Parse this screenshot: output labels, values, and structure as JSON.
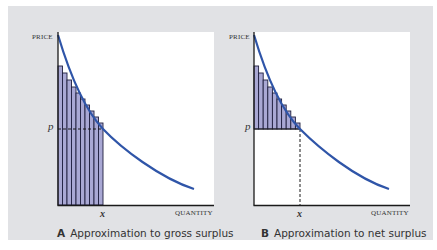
{
  "panels": [
    {
      "id": "A",
      "letter": "A",
      "caption": "Approximation to gross surplus",
      "y_axis_label": "PRICE",
      "x_axis_label": "QUANTITY",
      "price_label": "p",
      "quantity_label": "x",
      "shaded_region": "full bars from 0 to x",
      "bar_count": 10
    },
    {
      "id": "B",
      "letter": "B",
      "caption": "Approximation to net surplus",
      "y_axis_label": "PRICE",
      "x_axis_label": "QUANTITY",
      "price_label": "p",
      "quantity_label": "x",
      "shaded_region": "bars above p from 0 to x",
      "bar_count": 10
    }
  ],
  "colors": {
    "background": "#e1e2e5",
    "plot_area": "#ffffff",
    "curve": "#2f55a8",
    "bar_fill": "#a9a8d4",
    "bar_edge": "#1f1f3f",
    "axis": "#1a1a1a"
  }
}
